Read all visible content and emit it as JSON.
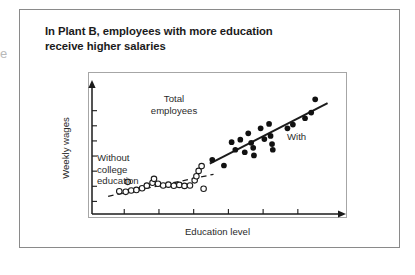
{
  "figure": {
    "title_lines": [
      "In Plant B, employees with more education",
      "receive higher salaries"
    ],
    "edge_fragment": "e",
    "annotations": {
      "total_employees_line1": "Total",
      "total_employees_line2": "employees",
      "without_line1": "Without",
      "without_line2": "college",
      "without_line3": "education",
      "with_label": "With"
    },
    "colors": {
      "ink": "#1b1b1b",
      "frame": "#a6a6a6",
      "outer_frame": "#8a8a8a",
      "marker_fill": "#111111",
      "marker_open_stroke": "#1b1b1b",
      "background": "#ffffff"
    }
  },
  "chart_data": {
    "type": "scatter",
    "title": "In Plant B, employees with more education receive higher salaries",
    "subtitle": "",
    "xlabel": "Education level",
    "ylabel": "Weekly wages",
    "xlim": [
      0,
      100
    ],
    "ylim": [
      0,
      100
    ],
    "grid": false,
    "legend_position": "in-plot annotations",
    "axis_ticks": {
      "x_tick_positions": [
        13,
        27,
        41,
        55,
        69,
        83
      ],
      "x_tick_labels": [],
      "y_tick_positions": [
        10,
        22,
        34,
        46,
        58,
        70,
        82
      ],
      "y_tick_labels": []
    },
    "annotations": [
      {
        "text": "Total employees",
        "x": 28,
        "y": 82,
        "note": "label for the whole population of employees"
      },
      {
        "text": "Without college education",
        "x": 6,
        "y": 45,
        "note": "label for the open-circle subgroup and its dashed trend line"
      },
      {
        "text": "With",
        "x": 78,
        "y": 60,
        "note": "label for the filled-circle subgroup (with college education) and its solid trend line"
      }
    ],
    "series": [
      {
        "name": "Without college education",
        "marker": "open-circle",
        "marker_size": 4.6,
        "color": "#1b1b1b",
        "points": [
          {
            "x": 11.0,
            "y": 18.0
          },
          {
            "x": 13.6,
            "y": 17.6
          },
          {
            "x": 15.8,
            "y": 18.6
          },
          {
            "x": 17.9,
            "y": 19.1
          },
          {
            "x": 20.2,
            "y": 20.4
          },
          {
            "x": 22.1,
            "y": 22.5
          },
          {
            "x": 14.4,
            "y": 25.5
          },
          {
            "x": 24.4,
            "y": 24.8
          },
          {
            "x": 26.6,
            "y": 24.0
          },
          {
            "x": 28.7,
            "y": 22.6
          },
          {
            "x": 30.8,
            "y": 23.3
          },
          {
            "x": 33.0,
            "y": 22.4
          },
          {
            "x": 25.0,
            "y": 27.9
          },
          {
            "x": 35.2,
            "y": 23.1
          },
          {
            "x": 37.3,
            "y": 22.3
          },
          {
            "x": 39.5,
            "y": 22.6
          },
          {
            "x": 41.4,
            "y": 26.7
          },
          {
            "x": 42.1,
            "y": 30.0
          },
          {
            "x": 43.0,
            "y": 34.2
          },
          {
            "x": 44.2,
            "y": 38.0
          },
          {
            "x": 45.0,
            "y": 20.0
          }
        ],
        "trend": {
          "style": "dashed",
          "x0": 6.5,
          "y0": 14.0,
          "x1": 49.0,
          "y1": 31.5
        }
      },
      {
        "name": "With college education",
        "marker": "filled-circle",
        "marker_size": 4.6,
        "color": "#111111",
        "points": [
          {
            "x": 48.5,
            "y": 43.0
          },
          {
            "x": 53.2,
            "y": 38.5
          },
          {
            "x": 56.3,
            "y": 57.0
          },
          {
            "x": 57.8,
            "y": 51.0
          },
          {
            "x": 59.8,
            "y": 59.0
          },
          {
            "x": 61.6,
            "y": 49.0
          },
          {
            "x": 63.0,
            "y": 64.0
          },
          {
            "x": 64.2,
            "y": 56.5
          },
          {
            "x": 65.0,
            "y": 52.5
          },
          {
            "x": 65.3,
            "y": 46.5
          },
          {
            "x": 68.0,
            "y": 68.0
          },
          {
            "x": 69.5,
            "y": 59.5
          },
          {
            "x": 71.4,
            "y": 71.5
          },
          {
            "x": 72.0,
            "y": 62.0
          },
          {
            "x": 72.6,
            "y": 55.5
          },
          {
            "x": 72.9,
            "y": 51.0
          },
          {
            "x": 78.8,
            "y": 68.0
          },
          {
            "x": 81.0,
            "y": 71.0
          },
          {
            "x": 85.9,
            "y": 76.0
          },
          {
            "x": 88.4,
            "y": 80.5
          },
          {
            "x": 90.0,
            "y": 91.0
          }
        ],
        "trend": {
          "style": "solid",
          "x0": 47.5,
          "y0": 40.0,
          "x1": 95.0,
          "y1": 88.0
        }
      }
    ]
  }
}
